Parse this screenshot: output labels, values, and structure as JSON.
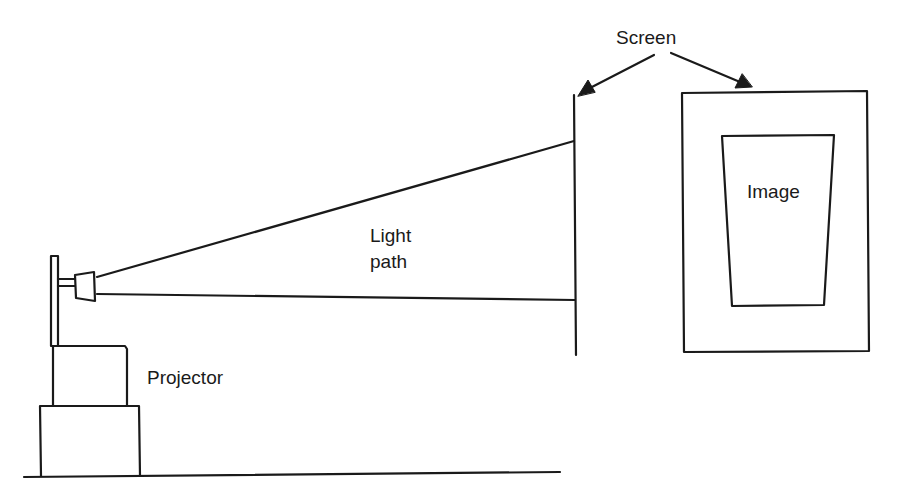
{
  "diagram": {
    "type": "projection-setup",
    "labels": {
      "screen": "Screen",
      "light_path_line1": "Light",
      "light_path_line2": "path",
      "projector": "Projector",
      "image": "Image"
    },
    "colors": {
      "stroke": "#1a1a1a",
      "background": "#ffffff"
    }
  }
}
